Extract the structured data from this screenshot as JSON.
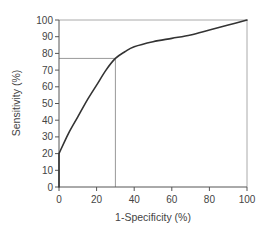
{
  "chart_data": {
    "type": "line",
    "title": "",
    "xlabel": "1-Specificity (%)",
    "ylabel": "Sensitivity (%)",
    "xlim": [
      0,
      100
    ],
    "ylim": [
      0,
      100
    ],
    "grid": false,
    "legend": null,
    "x_ticks": [
      0,
      20,
      40,
      60,
      80,
      100
    ],
    "y_ticks": [
      0,
      10,
      20,
      30,
      40,
      50,
      60,
      70,
      80,
      90,
      100
    ],
    "series": [
      {
        "name": "ROC curve",
        "color": "#333333",
        "x": [
          0,
          0,
          5,
          10,
          15,
          20,
          25,
          30,
          35,
          40,
          50,
          60,
          70,
          80,
          90,
          100
        ],
        "y": [
          0,
          20,
          32,
          42,
          52,
          61,
          70,
          77,
          81,
          84,
          87,
          89,
          91,
          94,
          97,
          100
        ]
      }
    ],
    "annotations": [
      {
        "type": "hline",
        "y": 77,
        "x_from": 0,
        "x_to": 30,
        "color": "#999999"
      },
      {
        "type": "vline",
        "x": 30,
        "y_from": 0,
        "y_to": 77,
        "color": "#999999"
      }
    ],
    "frame": {
      "top_line": true,
      "right_line": true,
      "color": "#aaaaaa"
    }
  },
  "layout": {
    "plot_left": 59,
    "plot_right": 247,
    "plot_top": 20,
    "plot_bottom": 187,
    "axis_color": "#555555",
    "frame_color": "#aaaaaa",
    "ref_color": "#999999",
    "curve_color": "#333333"
  }
}
